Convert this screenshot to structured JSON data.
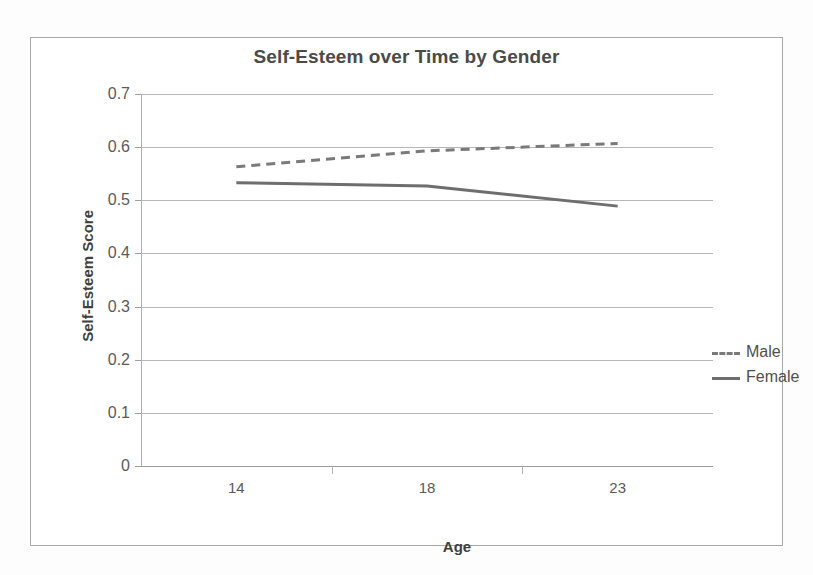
{
  "chart_data": {
    "type": "line",
    "title": "Self-Esteem over Time by Gender",
    "xlabel": "Age",
    "ylabel": "Self-Esteem Score",
    "categories": [
      "14",
      "18",
      "23"
    ],
    "ylim": [
      0,
      0.7
    ],
    "ytick_labels": [
      "0.7",
      "0.6",
      "0.5",
      "0.4",
      "0.3",
      "0.2",
      "0.1",
      "0"
    ],
    "ytick_values": [
      0.7,
      0.6,
      0.5,
      0.4,
      0.3,
      0.2,
      0.1,
      0
    ],
    "grid": true,
    "legend_position": "inside-right",
    "series": [
      {
        "name": "Male",
        "style": "dashed",
        "color": "#7a7a7a",
        "values": [
          0.563,
          0.593,
          0.607
        ]
      },
      {
        "name": "Female",
        "style": "solid",
        "color": "#6e6e6e",
        "values": [
          0.533,
          0.527,
          0.489
        ]
      }
    ]
  },
  "chart": {
    "title": "Self-Esteem over Time by Gender",
    "x_axis_title": "Age",
    "y_axis_title": "Self-Esteem Score"
  },
  "legend": {
    "items": [
      {
        "label": "Male"
      },
      {
        "label": "Female"
      }
    ]
  },
  "colors": {
    "frame": "#a8a8a8",
    "gridline": "#b6b6b6",
    "title_text": "#4a4a4a",
    "tick_text": "#5a5a5a",
    "male_line": "#7a7a7a",
    "female_line": "#6e6e6e"
  }
}
